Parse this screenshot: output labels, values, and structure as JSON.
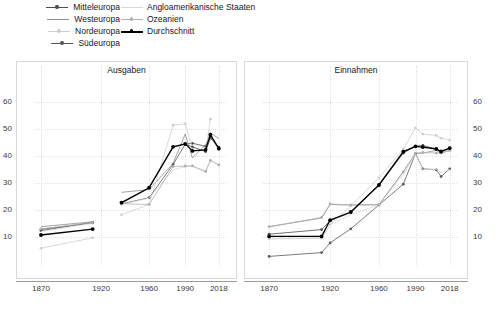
{
  "legend": {
    "items": [
      {
        "label": "Mitteleuropa",
        "color": "#4d4d4d",
        "marker": true,
        "col": 1,
        "row": 1
      },
      {
        "label": "Westeuropa",
        "color": "#8c8c8c",
        "marker": false,
        "col": 1,
        "row": 2
      },
      {
        "label": "Nordeuropa",
        "color": "#cfcfcf",
        "marker": true,
        "col": 1,
        "row": 3
      },
      {
        "label": "Südeuropa",
        "color": "#5a5a5a",
        "marker": true,
        "col": 1,
        "row": 4
      },
      {
        "label": "Angloamerikanische Staaten",
        "color": "#d9d9d9",
        "marker": false,
        "col": 2,
        "row": 1
      },
      {
        "label": "Ozeanien",
        "color": "#b0b0b0",
        "marker": true,
        "col": 2,
        "row": 2
      },
      {
        "label": "Durchschnitt",
        "color": "#000000",
        "marker": true,
        "col": 2,
        "row": 3
      }
    ]
  },
  "chart_data": [
    {
      "type": "line",
      "title": "Ausgaben",
      "xlabel": "",
      "ylabel": "",
      "ylim": [
        0,
        68
      ],
      "yticks": [
        10,
        20,
        30,
        40,
        50,
        60
      ],
      "x": [
        1870,
        1913,
        1920,
        1937,
        1960,
        1980,
        1990,
        1996,
        2007,
        2011,
        2018
      ],
      "xticks": [
        1870,
        1920,
        1960,
        1990,
        2018
      ],
      "grid": true,
      "legend_position": "top",
      "series": [
        {
          "name": "Mitteleuropa",
          "color": "#4d4d4d",
          "marker": true,
          "values": [
            12.8,
            15.2,
            null,
            22.5,
            28.0,
            43.3,
            44.3,
            44.6,
            43.5,
            47.0,
            42.5
          ]
        },
        {
          "name": "Westeuropa",
          "color": "#8c8c8c",
          "marker": false,
          "values": [
            13.8,
            15.6,
            null,
            26.5,
            27.5,
            37.2,
            48.0,
            39.2,
            44.0,
            48.5,
            46.3
          ]
        },
        {
          "name": "Nordeuropa",
          "color": "#cfcfcf",
          "marker": true,
          "values": [
            5.8,
            9.7,
            null,
            18.2,
            22.0,
            51.3,
            51.8,
            43.0,
            42.0,
            53.5,
            null
          ]
        },
        {
          "name": "Südeuropa",
          "color": "#5a5a5a",
          "marker": true,
          "values": [
            12.3,
            15.4,
            null,
            22.2,
            24.5,
            36.8,
            44.2,
            43.3,
            41.5,
            46.5,
            43.2
          ]
        },
        {
          "name": "Angloamerikanische Staaten",
          "color": "#d9d9d9",
          "marker": false,
          "values": [
            12.0,
            15.0,
            null,
            22.0,
            24.3,
            34.8,
            36.0,
            36.0,
            34.0,
            38.5,
            36.5
          ]
        },
        {
          "name": "Ozeanien",
          "color": "#b0b0b0",
          "marker": true,
          "values": [
            13.0,
            15.3,
            null,
            22.3,
            22.0,
            36.0,
            36.2,
            36.3,
            34.2,
            38.3,
            36.6
          ]
        },
        {
          "name": "Durchschnitt",
          "color": "#000000",
          "marker": true,
          "values": [
            10.7,
            12.9,
            null,
            22.7,
            28.2,
            43.3,
            44.4,
            41.8,
            42.2,
            47.8,
            42.7
          ]
        }
      ]
    },
    {
      "type": "line",
      "title": "Einnahmen",
      "xlabel": "",
      "ylabel": "",
      "ylim": [
        0,
        68
      ],
      "yticks": [
        10,
        20,
        30,
        40,
        50,
        60
      ],
      "x": [
        1870,
        1913,
        1920,
        1937,
        1960,
        1980,
        1990,
        1996,
        2007,
        2011,
        2018
      ],
      "xticks": [
        1870,
        1920,
        1960,
        1990,
        2018
      ],
      "grid": true,
      "legend_position": "top",
      "series": [
        {
          "name": "Mitteleuropa",
          "color": "#4d4d4d",
          "marker": true,
          "values": [
            11.0,
            12.7,
            16.0,
            19.0,
            29.0,
            41.0,
            43.5,
            43.8,
            42.5,
            41.8,
            42.8
          ]
        },
        {
          "name": "Westeuropa",
          "color": "#8c8c8c",
          "marker": false,
          "values": [
            13.8,
            17.0,
            22.0,
            21.8,
            21.9,
            34.2,
            40.8,
            41.0,
            42.0,
            41.0,
            42.0
          ]
        },
        {
          "name": "Nordeuropa",
          "color": "#cfcfcf",
          "marker": true,
          "values": [
            9.3,
            9.5,
            14.5,
            21.5,
            31.8,
            42.5,
            50.3,
            48.0,
            47.5,
            46.5,
            45.8
          ]
        },
        {
          "name": "Südeuropa",
          "color": "#5a5a5a",
          "marker": true,
          "values": [
            2.8,
            4.2,
            7.8,
            13.0,
            21.8,
            29.5,
            40.8,
            35.2,
            34.8,
            32.3,
            35.2
          ]
        },
        {
          "name": "Angloamerikanische Staaten",
          "color": "#d9d9d9",
          "marker": false,
          "values": [
            9.3,
            9.5,
            14.5,
            18.2,
            21.9,
            33.0,
            40.5,
            35.0,
            35.0,
            33.8,
            35.0
          ]
        },
        {
          "name": "Ozeanien",
          "color": "#b0b0b0",
          "marker": true,
          "values": [
            13.8,
            17.2,
            22.2,
            21.8,
            21.9,
            34.0,
            41.0,
            41.2,
            41.0,
            41.0,
            42.0
          ]
        },
        {
          "name": "Durchschnitt",
          "color": "#000000",
          "marker": true,
          "values": [
            10.2,
            10.2,
            16.2,
            19.2,
            29.2,
            41.5,
            43.5,
            43.2,
            42.5,
            41.5,
            42.8
          ]
        }
      ]
    }
  ]
}
